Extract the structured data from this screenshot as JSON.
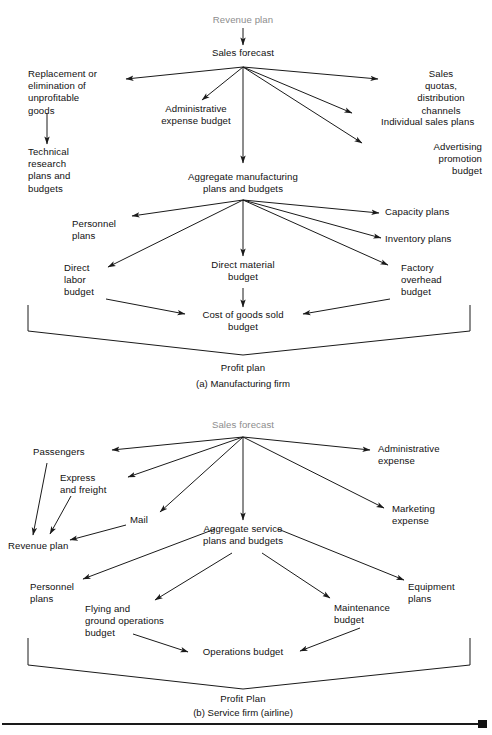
{
  "figure": {
    "panels": [
      {
        "id": "a",
        "caption": "(a) Manufacturing firm",
        "result_label": "Profit plan",
        "nodes": {
          "revenue_plan": "Revenue plan",
          "sales_forecast": "Sales forecast",
          "replacement": "Replacement or\nelimination of\nunprofitable\ngoods",
          "technical_research": "Technical\nresearch\nplans and\nbudgets",
          "admin_expense_budget": "Administrative\nexpense budget",
          "sales_quotas": "Sales quotas,\ndistribution channels",
          "individual_sales_plans": "Individual sales plans",
          "advertising_promotion": "Advertising promotion\nbudget",
          "aggregate_manufacturing": "Aggregate manufacturing\nplans and budgets",
          "personnel_plans": "Personnel\nplans",
          "capacity_plans": "Capacity plans",
          "inventory_plans": "Inventory plans",
          "direct_material_budget": "Direct material\nbudget",
          "direct_labor_budget": "Direct\nlabor\nbudget",
          "factory_overhead_budget": "Factory\noverhead\nbudget",
          "cost_of_goods_sold": "Cost of goods sold\nbudget"
        }
      },
      {
        "id": "b",
        "caption": "(b) Service firm (airline)",
        "result_label": "Profit Plan",
        "nodes": {
          "sales_forecast": "Sales forecast",
          "passengers": "Passengers",
          "express_freight": "Express\nand freight",
          "mail": "Mail",
          "revenue_plan": "Revenue plan",
          "administrative_expense": "Administrative\nexpense",
          "marketing_expense": "Marketing\nexpense",
          "aggregate_service": "Aggregate service\nplans and budgets",
          "personnel_plans": "Personnel\nplans",
          "equipment_plans": "Equipment\nplans",
          "flying_ground_ops": "Flying and\nground operations\nbudget",
          "maintenance_budget": "Maintenance\nbudget",
          "operations_budget": "Operations budget"
        }
      }
    ],
    "colors": {
      "text": "#111111",
      "muted_text": "#8d8d8d",
      "stroke": "#1a1a1a",
      "background": "#ffffff"
    }
  }
}
